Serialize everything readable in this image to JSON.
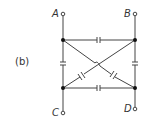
{
  "figure_label": "(b)",
  "terminals": {
    "A": "A",
    "B": "B",
    "C": "C",
    "D": "D"
  },
  "diagram": {
    "type": "capacitor network",
    "nodes": [
      "top-left",
      "top-right",
      "bottom-left",
      "bottom-right"
    ],
    "capacitors": [
      "top",
      "bottom",
      "left",
      "right",
      "diagonal-1",
      "diagonal-2"
    ],
    "colors": {
      "line": "#444444",
      "node": "#111111"
    }
  }
}
